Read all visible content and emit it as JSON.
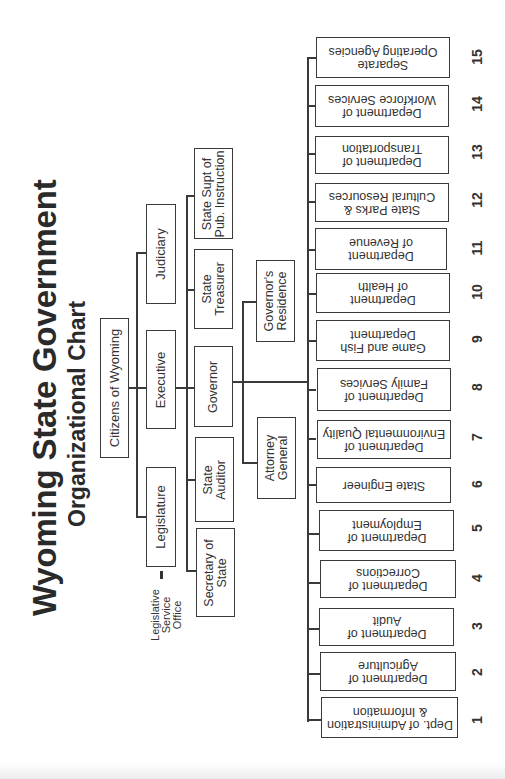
{
  "title": "Wyoming State Government",
  "subtitle": "Organizational Chart",
  "root": {
    "label": "Citizens of Wyoming"
  },
  "branches": {
    "judiciary": "Judiciary",
    "executive": "Executive",
    "legislature": "Legislature"
  },
  "legislative_service_office": "Legislative\nService\nOffice",
  "elected_officials": {
    "state_supt": "State Supt of\nPub. Instruction",
    "state_treasurer": "State\nTreasurer",
    "governor": "Governor",
    "state_auditor": "State\nAuditor",
    "secretary_of_state": "Secretary of\nState"
  },
  "governor_staff": {
    "governors_residence": "Governor's\nResidence",
    "attorney_general": "Attorney\nGeneral"
  },
  "departments": [
    {
      "number": "1",
      "label": "Dept. of Administration\n& Information"
    },
    {
      "number": "2",
      "label": "Department of\nAgriculture"
    },
    {
      "number": "3",
      "label": "Department of\nAudit"
    },
    {
      "number": "4",
      "label": "Department of\nCorrections"
    },
    {
      "number": "5",
      "label": "Department of\nEmployment"
    },
    {
      "number": "6",
      "label": "State Engineer"
    },
    {
      "number": "7",
      "label": "Department of\nEnvironmental Quality"
    },
    {
      "number": "8",
      "label": "Department of\nFamily Services"
    },
    {
      "number": "9",
      "label": "Game and Fish\nDepartment"
    },
    {
      "number": "10",
      "label": "Department\nof Health"
    },
    {
      "number": "11",
      "label": "Department\nof Revenue"
    },
    {
      "number": "12",
      "label": "State Parks &\nCultural Resources"
    },
    {
      "number": "13",
      "label": "Department of\nTransportation"
    },
    {
      "number": "14",
      "label": "Department of\nWorkforce Services"
    },
    {
      "number": "15",
      "label": "Separate\nOperating Agencies"
    }
  ],
  "colors": {
    "line": "#3a3a3a",
    "text": "#333333",
    "background": "#ffffff"
  }
}
